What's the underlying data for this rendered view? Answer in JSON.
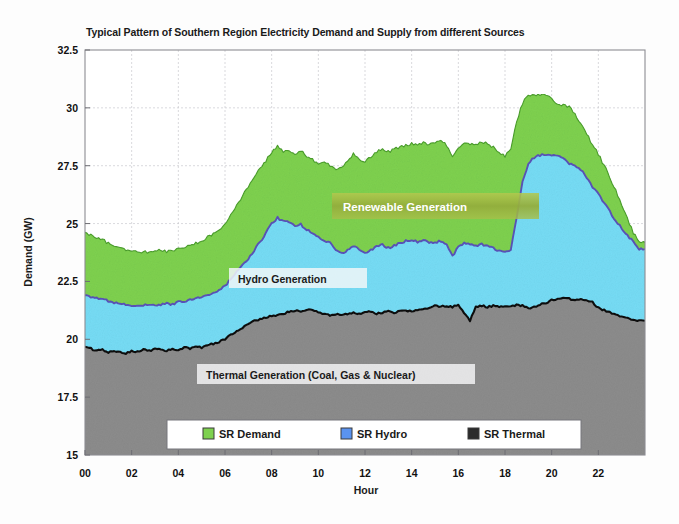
{
  "chart_data": {
    "type": "area",
    "title": "Typical Pattern of Southern Region Electricity Demand and Supply from different Sources",
    "xlabel": "Hour",
    "ylabel": "Demand (GW)",
    "xlim": [
      0,
      24
    ],
    "ylim": [
      15,
      32.5
    ],
    "yticks": [
      15,
      17.5,
      20,
      22.5,
      25,
      27.5,
      30,
      32.5
    ],
    "ytick_labels": [
      "15",
      "17.5",
      "20",
      "22.5",
      "25",
      "27.5",
      "30",
      "32.5"
    ],
    "xticks": [
      0,
      2,
      4,
      6,
      8,
      10,
      12,
      14,
      16,
      18,
      20,
      22
    ],
    "xtick_labels": [
      "00",
      "02",
      "04",
      "06",
      "08",
      "10",
      "12",
      "14",
      "16",
      "18",
      "20",
      "22"
    ],
    "grid": true,
    "stacked": true,
    "legend_position": "lower center",
    "colors": {
      "demand_fill": "#7ED14F",
      "demand_line": "#4a9e2a",
      "hydro_fill": "#76DCF5",
      "hydro_line": "#5a53b8",
      "thermal_fill": "#8C8C8C",
      "thermal_line": "#111111",
      "plot_background": "#ffffff",
      "frame": "#8d8d93"
    },
    "x": [
      0,
      0.25,
      0.5,
      0.75,
      1,
      1.25,
      1.5,
      1.75,
      2,
      2.25,
      2.5,
      2.75,
      3,
      3.25,
      3.5,
      3.75,
      4,
      4.25,
      4.5,
      4.75,
      5,
      5.25,
      5.5,
      5.75,
      6,
      6.25,
      6.5,
      6.75,
      7,
      7.25,
      7.5,
      7.75,
      8,
      8.25,
      8.5,
      8.75,
      9,
      9.25,
      9.5,
      9.75,
      10,
      10.25,
      10.5,
      10.75,
      11,
      11.25,
      11.5,
      11.75,
      12,
      12.25,
      12.5,
      12.75,
      13,
      13.25,
      13.5,
      13.75,
      14,
      14.25,
      14.5,
      14.75,
      15,
      15.25,
      15.5,
      15.75,
      16,
      16.25,
      16.5,
      16.75,
      17,
      17.25,
      17.5,
      17.75,
      18,
      18.25,
      18.5,
      18.75,
      19,
      19.25,
      19.5,
      19.75,
      20,
      20.25,
      20.5,
      20.75,
      21,
      21.25,
      21.5,
      21.75,
      22,
      22.25,
      22.5,
      22.75,
      23,
      23.25,
      23.5,
      23.75
    ],
    "series": [
      {
        "name": "SR Thermal",
        "label": "SR Thermal",
        "annotation": "Thermal Generation (Coal, Gas & Nuclear)",
        "values": [
          19.65,
          19.6,
          19.5,
          19.55,
          19.45,
          19.5,
          19.45,
          19.4,
          19.5,
          19.45,
          19.55,
          19.5,
          19.6,
          19.55,
          19.5,
          19.6,
          19.55,
          19.65,
          19.6,
          19.7,
          19.65,
          19.75,
          19.8,
          19.9,
          20.0,
          20.2,
          20.35,
          20.5,
          20.65,
          20.8,
          20.85,
          20.95,
          21.0,
          21.05,
          21.1,
          21.2,
          21.25,
          21.2,
          21.3,
          21.25,
          21.15,
          21.1,
          21.05,
          21.1,
          21.05,
          21.1,
          21.15,
          21.1,
          21.15,
          21.2,
          21.1,
          21.15,
          21.2,
          21.15,
          21.2,
          21.25,
          21.2,
          21.25,
          21.3,
          21.35,
          21.45,
          21.4,
          21.45,
          21.4,
          21.5,
          21.15,
          20.8,
          21.4,
          21.45,
          21.4,
          21.45,
          21.4,
          21.45,
          21.4,
          21.5,
          21.45,
          21.35,
          21.4,
          21.5,
          21.55,
          21.7,
          21.75,
          21.8,
          21.75,
          21.7,
          21.75,
          21.65,
          21.6,
          21.35,
          21.25,
          21.15,
          21.05,
          20.95,
          20.9,
          20.85,
          20.8
        ]
      },
      {
        "name": "SR Hydro",
        "label": "SR Hydro",
        "annotation": "Hydro Generation",
        "values": [
          21.9,
          21.85,
          21.8,
          21.75,
          21.65,
          21.6,
          21.55,
          21.5,
          21.45,
          21.5,
          21.45,
          21.5,
          21.45,
          21.5,
          21.55,
          21.5,
          21.6,
          21.65,
          21.7,
          21.75,
          21.8,
          21.9,
          22.0,
          22.15,
          22.3,
          22.6,
          22.9,
          23.2,
          23.5,
          23.85,
          24.2,
          24.6,
          25.0,
          25.25,
          25.1,
          25.05,
          24.9,
          24.95,
          24.75,
          24.6,
          24.4,
          24.3,
          24.15,
          23.9,
          23.7,
          23.85,
          24.05,
          23.9,
          23.75,
          23.85,
          24.0,
          24.1,
          23.95,
          24.05,
          24.15,
          24.25,
          24.3,
          24.2,
          24.3,
          24.2,
          24.15,
          24.25,
          24.1,
          23.6,
          24.0,
          24.15,
          24.1,
          24.05,
          24.1,
          24.05,
          23.95,
          23.8,
          23.75,
          23.9,
          25.3,
          26.8,
          27.6,
          27.85,
          27.95,
          28.0,
          27.95,
          27.9,
          27.8,
          27.6,
          27.5,
          27.35,
          27.0,
          26.6,
          26.3,
          25.9,
          25.5,
          25.1,
          24.8,
          24.5,
          24.2,
          23.9
        ]
      },
      {
        "name": "SR Demand",
        "label": "SR Demand",
        "annotation": "Renewable Generation",
        "values": [
          24.6,
          24.5,
          24.4,
          24.3,
          24.15,
          24.05,
          23.95,
          23.85,
          23.8,
          23.75,
          23.8,
          23.75,
          23.8,
          23.85,
          23.8,
          23.85,
          23.9,
          24.0,
          24.05,
          24.15,
          24.25,
          24.4,
          24.55,
          24.75,
          25.0,
          25.4,
          25.8,
          26.2,
          26.6,
          27.0,
          27.35,
          27.7,
          28.1,
          28.35,
          28.1,
          28.2,
          27.95,
          28.15,
          27.9,
          27.75,
          27.6,
          27.7,
          27.5,
          27.3,
          27.45,
          27.7,
          28.0,
          27.8,
          27.7,
          27.9,
          28.1,
          28.25,
          28.1,
          28.2,
          28.3,
          28.4,
          28.45,
          28.35,
          28.5,
          28.4,
          28.5,
          28.55,
          28.4,
          27.9,
          28.3,
          28.5,
          28.45,
          28.4,
          28.5,
          28.45,
          28.3,
          28.1,
          27.9,
          28.2,
          29.4,
          30.2,
          30.55,
          30.6,
          30.55,
          30.6,
          30.45,
          30.1,
          30.15,
          30.05,
          29.7,
          29.3,
          28.9,
          28.4,
          28.0,
          27.5,
          27.0,
          26.4,
          25.8,
          25.2,
          24.6,
          24.2
        ]
      }
    ],
    "legend": [
      {
        "label": "SR Demand",
        "color": "#7ED14F"
      },
      {
        "label": "SR Hydro",
        "color": "#5A93F0"
      },
      {
        "label": "SR Thermal",
        "color": "#2b2b2b"
      }
    ],
    "annotations": [
      {
        "text": "Renewable Generation",
        "style": "light-on-olive"
      },
      {
        "text": "Hydro Generation",
        "style": "dark-on-light"
      },
      {
        "text": "Thermal Generation (Coal, Gas & Nuclear)",
        "style": "dark-on-light"
      }
    ]
  }
}
